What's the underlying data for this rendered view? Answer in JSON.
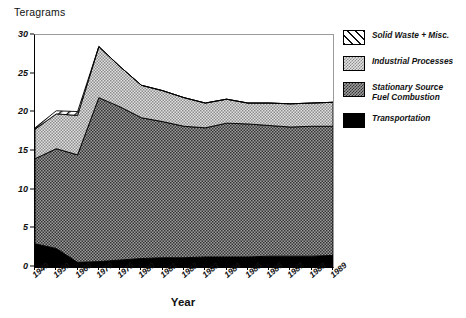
{
  "chart_data": {
    "type": "area",
    "title": "",
    "ylabel": "Teragrams",
    "xlabel": "Year",
    "ylim": [
      0,
      30
    ],
    "yticks": [
      0,
      5,
      10,
      15,
      20,
      25,
      30
    ],
    "grid": false,
    "legend_position": "right",
    "stacked": true,
    "categories": [
      "1940",
      "1950",
      "1960",
      "1970",
      "1975",
      "1980",
      "1981",
      "1982",
      "1983",
      "1984",
      "1985",
      "1986",
      "1987",
      "1988",
      "1989"
    ],
    "series": [
      {
        "name": "Transportation",
        "color": "#000000",
        "pattern": "solid",
        "values": [
          3.0,
          2.4,
          0.6,
          0.7,
          0.9,
          1.1,
          1.2,
          1.2,
          1.3,
          1.3,
          1.3,
          1.4,
          1.4,
          1.4,
          1.5
        ]
      },
      {
        "name": "Stationary Source Fuel Combustion",
        "color": "#8a8a8a",
        "pattern": "dense-stipple",
        "values": [
          11.0,
          12.9,
          13.9,
          21.2,
          19.8,
          18.2,
          17.6,
          17.0,
          16.7,
          17.3,
          17.2,
          16.9,
          16.7,
          16.8,
          16.7
        ]
      },
      {
        "name": "Industrial Processes",
        "color": "#c9c9c9",
        "pattern": "light-stipple",
        "values": [
          3.8,
          4.5,
          5.1,
          6.6,
          5.2,
          4.2,
          4.0,
          3.7,
          3.2,
          3.1,
          2.7,
          2.9,
          3.0,
          3.0,
          3.1
        ]
      },
      {
        "name": "Solid Waste + Misc.",
        "color": "#ffffff",
        "pattern": "diagonal-hatch",
        "values": [
          0.2,
          0.4,
          0.5,
          0.0,
          0.0,
          0.0,
          0.0,
          0.0,
          0.0,
          0.0,
          0.0,
          0.0,
          0.0,
          0.0,
          0.0
        ]
      }
    ],
    "totals": [
      18.0,
      20.2,
      20.1,
      28.5,
      25.9,
      23.5,
      22.8,
      21.9,
      21.2,
      21.7,
      21.2,
      21.2,
      21.1,
      21.2,
      21.3
    ]
  },
  "legend": {
    "items": [
      {
        "label": "Solid Waste + Misc.",
        "label2": "",
        "swatch": "diagonal-hatch"
      },
      {
        "label": "Industrial Processes",
        "label2": "",
        "swatch": "light-stipple"
      },
      {
        "label": "Stationary Source",
        "label2": "Fuel Combustion",
        "swatch": "dense-stipple"
      },
      {
        "label": "Transportation",
        "label2": "",
        "swatch": "solid-black"
      }
    ]
  },
  "axes": {
    "y_title": "Teragrams",
    "x_title": "Year"
  }
}
